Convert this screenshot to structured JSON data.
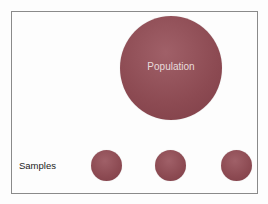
{
  "diagram": {
    "population": {
      "label": "Population",
      "color": "#8c4a52"
    },
    "samples": {
      "label": "Samples",
      "items": [
        {
          "id": 1,
          "color": "#8c4a52"
        },
        {
          "id": 2,
          "color": "#8c4a52"
        },
        {
          "id": 3,
          "color": "#8c4a52"
        }
      ]
    }
  }
}
